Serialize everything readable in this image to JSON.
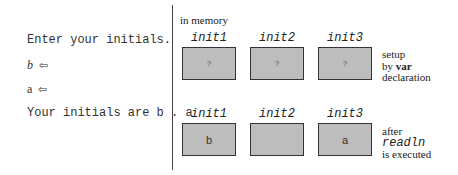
{
  "console": {
    "prompt": "Enter your initials.",
    "input1": "b",
    "input2": "a",
    "output": "Your initials are b . a",
    "enter_glyph": "⇦"
  },
  "memory": {
    "label": "in memory",
    "rows": [
      {
        "cells": [
          {
            "name": "init1",
            "value": "?"
          },
          {
            "name": "init2",
            "value": "?"
          },
          {
            "name": "init3",
            "value": "?"
          }
        ],
        "note": {
          "line1": "setup",
          "line2_prefix": "by ",
          "line2_bold": "var",
          "line3": "declaration"
        }
      },
      {
        "cells": [
          {
            "name": "init1",
            "value": "b"
          },
          {
            "name": "init2",
            "value": ""
          },
          {
            "name": "init3",
            "value": "a"
          }
        ],
        "note": {
          "line1": "after",
          "line2": "readln",
          "line3": "is executed"
        }
      }
    ]
  },
  "colors": {
    "box_fill": "#bdbdbd",
    "box_border": "#333333",
    "divider": "#444444"
  }
}
